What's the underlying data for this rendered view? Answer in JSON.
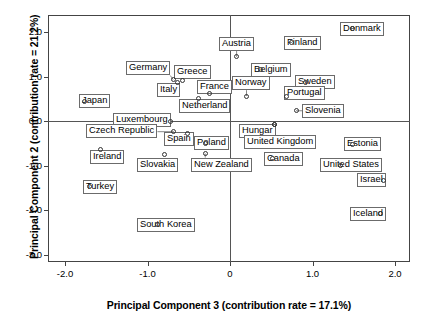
{
  "axes": {
    "x_title": "Principal Component 3 (contribution rate = 17.1%)",
    "y_title": "Principal Component 2 (contribution rate = 21.2%)",
    "x_ticks": [
      "-2.0",
      "-1.0",
      "0",
      "1.0",
      "2.0"
    ],
    "y_ticks": [
      "2.0",
      "1.0",
      "0.0",
      "-1.0",
      "-2.0",
      "-3.0"
    ]
  },
  "chart_data": {
    "type": "scatter",
    "title": "",
    "xlabel": "Principal Component 3 (contribution rate = 17.1%)",
    "ylabel": "Principal Component 2 (contribution rate = 21.2%)",
    "xlim": [
      -2.23,
      2.19
    ],
    "ylim": [
      -3.22,
      2.25
    ],
    "xticks": [
      -2.0,
      -1.0,
      0.0,
      1.0,
      2.0
    ],
    "yticks": [
      2.0,
      1.0,
      0.0,
      -1.0,
      -2.0,
      -3.0
    ],
    "grid": false,
    "reference_lines": {
      "x": 0.0,
      "y": 0.0
    },
    "legend": "none",
    "marker": "open-circle",
    "points": [
      {
        "label": "Denmark",
        "x": 1.48,
        "y": 2.07,
        "lx": 1.6,
        "ly": 2.07
      },
      {
        "label": "Finland",
        "x": 0.74,
        "y": 1.76,
        "lx": 0.88,
        "ly": 1.76
      },
      {
        "label": "Austria",
        "x": 0.08,
        "y": 1.44,
        "lx": 0.08,
        "ly": 1.74
      },
      {
        "label": "Belgium",
        "x": 0.37,
        "y": 1.15,
        "lx": 0.5,
        "ly": 1.15
      },
      {
        "label": "Germany",
        "x": -0.69,
        "y": 0.93,
        "lx": -0.99,
        "ly": 1.18
      },
      {
        "label": "Greece",
        "x": -0.58,
        "y": 0.91,
        "lx": -0.46,
        "ly": 1.09
      },
      {
        "label": "Italy",
        "x": -0.64,
        "y": 0.86,
        "lx": -0.75,
        "ly": 0.7
      },
      {
        "label": "Sweden",
        "x": 0.91,
        "y": 0.87,
        "lx": 1.03,
        "ly": 0.87
      },
      {
        "label": "France",
        "x": -0.25,
        "y": 0.62,
        "lx": -0.19,
        "ly": 0.76
      },
      {
        "label": "Norway",
        "x": 0.2,
        "y": 0.56,
        "lx": 0.26,
        "ly": 0.85
      },
      {
        "label": "Portugal",
        "x": 0.68,
        "y": 0.55,
        "lx": 0.9,
        "ly": 0.62
      },
      {
        "label": "Japan",
        "x": -1.76,
        "y": 0.44,
        "lx": -1.64,
        "ly": 0.44
      },
      {
        "label": "Netherland",
        "x": -0.38,
        "y": 0.51,
        "lx": -0.31,
        "ly": 0.33
      },
      {
        "label": "Slovenia",
        "x": 0.8,
        "y": 0.23,
        "lx": 1.13,
        "ly": 0.23
      },
      {
        "label": "Luxembourg",
        "x": -0.72,
        "y": -0.02,
        "lx": -1.07,
        "ly": 0.02
      },
      {
        "label": "Hungar",
        "x": 0.54,
        "y": -0.07,
        "lx": 0.33,
        "ly": -0.22
      },
      {
        "label": "Czech Republic",
        "x": -0.68,
        "y": -0.24,
        "lx": -1.31,
        "ly": -0.22
      },
      {
        "label": "Spain",
        "x": -0.51,
        "y": -0.28,
        "lx": -0.62,
        "ly": -0.4
      },
      {
        "label": "Poland",
        "x": -0.3,
        "y": -0.5,
        "lx": -0.22,
        "ly": -0.5
      },
      {
        "label": "United Kingdom",
        "x": 0.54,
        "y": -0.07,
        "lx": 0.61,
        "ly": -0.48
      },
      {
        "label": "Estonia",
        "x": 1.48,
        "y": -0.52,
        "lx": 1.61,
        "ly": -0.52
      },
      {
        "label": "Ireland",
        "x": -1.57,
        "y": -0.63,
        "lx": -1.49,
        "ly": -0.8
      },
      {
        "label": "Slovakia",
        "x": -0.8,
        "y": -0.75,
        "lx": -0.88,
        "ly": -0.98
      },
      {
        "label": "Canada",
        "x": 0.52,
        "y": -0.85,
        "lx": 0.65,
        "ly": -0.85
      },
      {
        "label": "New Zealand",
        "x": -0.3,
        "y": -0.73,
        "lx": -0.1,
        "ly": -0.98
      },
      {
        "label": "United States",
        "x": 1.34,
        "y": -0.99,
        "lx": 1.47,
        "ly": -0.99
      },
      {
        "label": "Israel",
        "x": 1.86,
        "y": -1.33,
        "lx": 1.72,
        "ly": -1.33
      },
      {
        "label": "Turkey",
        "x": -1.7,
        "y": -1.48,
        "lx": -1.58,
        "ly": -1.48
      },
      {
        "label": "Iceland",
        "x": 1.83,
        "y": -2.08,
        "lx": 1.67,
        "ly": -2.08
      },
      {
        "label": "South Korea",
        "x": -0.88,
        "y": -2.33,
        "lx": -0.77,
        "ly": -2.33
      }
    ]
  }
}
